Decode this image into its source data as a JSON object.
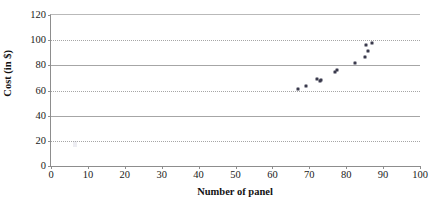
{
  "chart_data": {
    "type": "scatter",
    "title": "",
    "xlabel": "Number of panel",
    "ylabel": "Cost (in $)",
    "xlim": [
      0,
      100
    ],
    "ylim": [
      0,
      120
    ],
    "xticks": [
      0,
      10,
      20,
      30,
      40,
      50,
      60,
      70,
      80,
      90,
      100
    ],
    "yticks": [
      0,
      20,
      40,
      60,
      80,
      100,
      120
    ],
    "grid": {
      "horizontal": true,
      "vertical": false,
      "styles": {
        "20": "dotted",
        "40": "solid",
        "60": "dotted",
        "80": "solid",
        "100": "dotted"
      }
    },
    "legend": null,
    "marker_color": "#3a3a4d",
    "series": [
      {
        "name": "Cost vs number of panel",
        "points": [
          {
            "x": 67.0,
            "y": 61.5
          },
          {
            "x": 69.0,
            "y": 63.5
          },
          {
            "x": 72.0,
            "y": 69.5
          },
          {
            "x": 72.8,
            "y": 67.8
          },
          {
            "x": 73.2,
            "y": 68.5
          },
          {
            "x": 77.0,
            "y": 75.0
          },
          {
            "x": 77.6,
            "y": 76.0
          },
          {
            "x": 82.3,
            "y": 81.5
          },
          {
            "x": 85.0,
            "y": 86.5
          },
          {
            "x": 85.3,
            "y": 96.0
          },
          {
            "x": 86.0,
            "y": 91.5
          },
          {
            "x": 87.0,
            "y": 98.0
          }
        ]
      }
    ]
  }
}
